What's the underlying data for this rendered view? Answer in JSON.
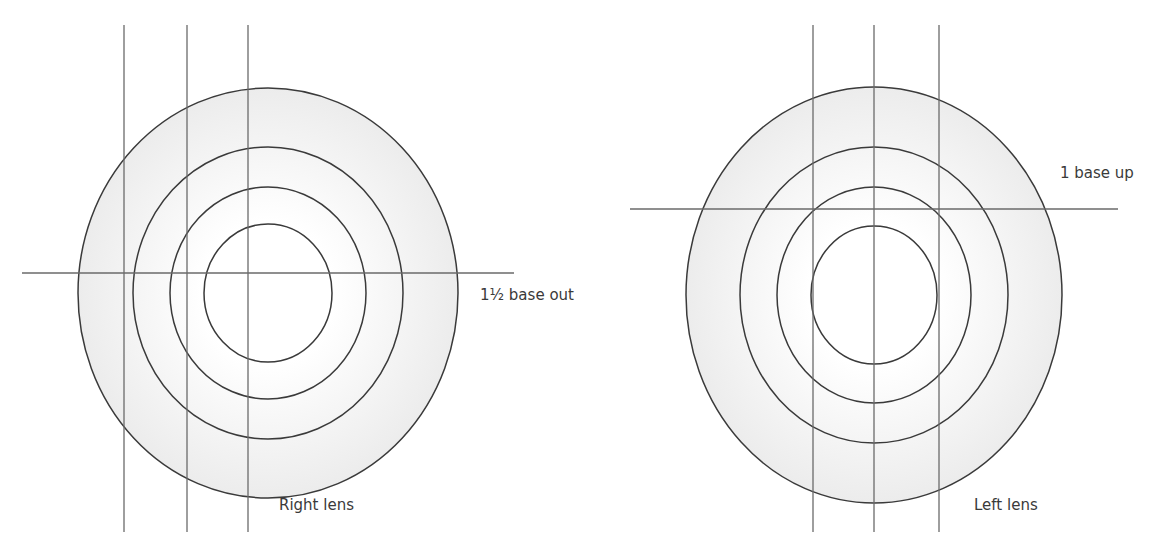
{
  "figure": {
    "colors": {
      "stroke": "#3a3a3a",
      "guide": "#6a6a6a",
      "fill_outer": "#ececec",
      "fill_inner": "#ffffff"
    },
    "lenses": [
      {
        "name": "right-lens",
        "label": "Right lens",
        "prism_label": "1½ base out",
        "center": [
          268,
          293
        ],
        "rings_rx": [
          190,
          135,
          98,
          64
        ],
        "rings_ry": [
          205,
          146,
          106,
          69
        ],
        "vertical_lines_x": [
          124,
          187,
          248
        ],
        "horizontal_line_y": 273,
        "horizontal_line_x": [
          22,
          514
        ]
      },
      {
        "name": "left-lens",
        "label": "Left lens",
        "prism_label": "1 base up",
        "center": [
          874,
          295
        ],
        "rings_rx": [
          188,
          134,
          97,
          63
        ],
        "rings_ry": [
          208,
          148,
          108,
          69
        ],
        "vertical_lines_x": [
          813,
          874,
          939
        ],
        "horizontal_line_y": 209,
        "horizontal_line_x": [
          630,
          1118
        ]
      }
    ],
    "vertical_line_span": [
      25,
      532
    ]
  }
}
